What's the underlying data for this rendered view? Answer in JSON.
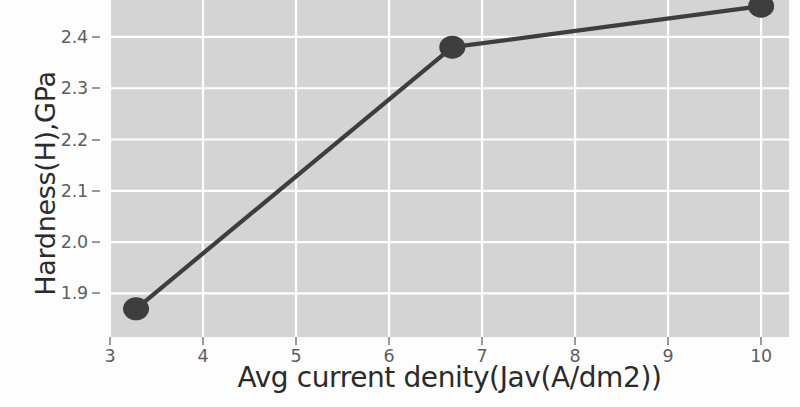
{
  "chart_data": {
    "type": "line",
    "title": "",
    "xlabel": "Avg current denity(Jav(A/dm2))",
    "ylabel": "Hardness(H),GPa",
    "x": [
      3.28,
      6.68,
      10.0
    ],
    "values": [
      1.87,
      2.38,
      2.46
    ],
    "series": [
      {
        "name": "Hardness",
        "x": [
          3.28,
          6.68,
          10.0
        ],
        "values": [
          1.87,
          2.38,
          2.46
        ]
      }
    ],
    "xlim": [
      3.0,
      10.3
    ],
    "ylim": [
      1.815,
      2.472
    ],
    "xticks": [
      3,
      4,
      5,
      6,
      7,
      8,
      9,
      10
    ],
    "xtick_labels": [
      "3",
      "4",
      "5",
      "6",
      "7",
      "8",
      "9",
      "10"
    ],
    "yticks": [
      1.9,
      2.0,
      2.1,
      2.2,
      2.3,
      2.4
    ],
    "ytick_labels": [
      "1.9",
      "2.0",
      "2.1",
      "2.2",
      "2.3",
      "2.4"
    ],
    "grid": true,
    "legend": false,
    "marker": "circle",
    "colors": {
      "line": "#3d3d3d",
      "marker": "#3d3d3d",
      "plot_background": "#d5d5d5",
      "grid": "#ffffff",
      "figure_background": "#fdfdfd",
      "tick_text": "#5f5f5f",
      "axis_title_text": "#2b2b2b"
    }
  }
}
